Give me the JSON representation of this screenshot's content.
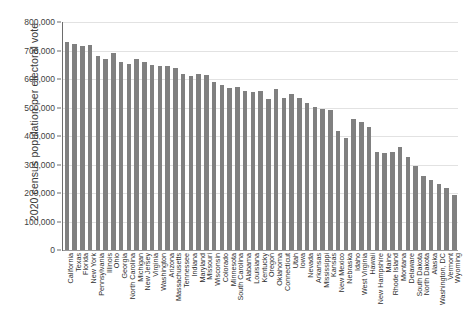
{
  "chart_data": {
    "type": "bar",
    "title": "",
    "xlabel": "",
    "ylabel": "2020 census population per electoral vote",
    "ylim": [
      0,
      800000
    ],
    "ytick_labels": [
      "800,000",
      "700,000",
      "600,000",
      "500,000",
      "400,000",
      "300,000",
      "200,000",
      "100,000",
      "0"
    ],
    "ytick_values": [
      800000,
      700000,
      600000,
      500000,
      400000,
      300000,
      200000,
      100000,
      0
    ],
    "grid": true,
    "legend": "none",
    "bar_color": "#808080",
    "gridline_color": "#e2e2e2",
    "axis_color": "#6d6d6d",
    "categories": [
      "California",
      "Texas",
      "Florida",
      "New York",
      "Pennsylvania",
      "Illinois",
      "Ohio",
      "Georgia",
      "North Carolina",
      "Michigan",
      "New Jersey",
      "Virginia",
      "Washington",
      "Arizona",
      "Massachusetts",
      "Tennessee",
      "Indiana",
      "Maryland",
      "Missouri",
      "Wisconsin",
      "Colorado",
      "Minnesota",
      "South Carolina",
      "Alabama",
      "Louisiana",
      "Kentucky",
      "Oregon",
      "Oklahoma",
      "Connecticut",
      "Utah",
      "Iowa",
      "Nevada",
      "Arkansas",
      "Mississippi",
      "Kansas",
      "New Mexico",
      "Nebraska",
      "Idaho",
      "West Virginia",
      "Hawaii",
      "New Hampshire",
      "Maine",
      "Rhode Island",
      "Montana",
      "Delaware",
      "South Dakota",
      "North Dakota",
      "Alaska",
      "Washington, DC",
      "Vermont",
      "Wyoming"
    ],
    "values": [
      729000,
      724000,
      715000,
      719000,
      681000,
      670000,
      690000,
      658000,
      654000,
      670000,
      661000,
      650000,
      647000,
      647000,
      637000,
      618000,
      612000,
      616000,
      614000,
      589000,
      578000,
      569000,
      572000,
      559000,
      554000,
      558000,
      529000,
      564000,
      535000,
      546000,
      532000,
      517000,
      503000,
      494000,
      490000,
      419000,
      392000,
      459000,
      448000,
      430000,
      344000,
      340000,
      344000,
      363000,
      326000,
      295000,
      261000,
      245000,
      230000,
      216000,
      192000
    ],
    "data_labels": false,
    "n_categories": 51
  }
}
